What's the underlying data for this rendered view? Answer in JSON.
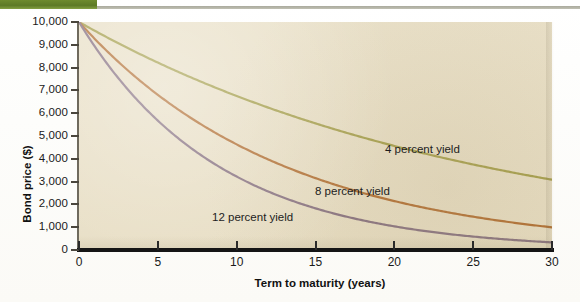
{
  "figure": {
    "background_color": "#e7ddc2",
    "page_color": "#ffffff",
    "accent_tab_color": "#5d7a26"
  },
  "chart_data": {
    "type": "line",
    "title": "",
    "xlabel": "Term to maturity (years)",
    "ylabel": "Bond price ($)",
    "xlim": [
      0,
      30
    ],
    "ylim": [
      0,
      10000
    ],
    "grid": false,
    "legend_position": "inline-annotations",
    "x_ticks": [
      0,
      5,
      10,
      15,
      20,
      25,
      30
    ],
    "x_tick_labels": [
      "0",
      "5",
      "10",
      "15",
      "20",
      "25",
      "30"
    ],
    "y_ticks": [
      0,
      1000,
      2000,
      3000,
      4000,
      5000,
      6000,
      7000,
      8000,
      9000,
      10000
    ],
    "y_tick_labels": [
      "0",
      "1,000",
      "2,000",
      "3,000",
      "4,000",
      "5,000",
      "6,000",
      "7,000",
      "8,000",
      "9,000",
      "10,000"
    ],
    "x": [
      0,
      2,
      4,
      6,
      8,
      10,
      12,
      14,
      16,
      18,
      20,
      22,
      24,
      26,
      28,
      30
    ],
    "series": [
      {
        "name": "4 percent yield",
        "color": "#9a9438",
        "yield": 0.04,
        "values": [
          10000,
          9246,
          8548,
          7903,
          7307,
          6756,
          6246,
          5775,
          5339,
          4936,
          4564,
          4220,
          3901,
          3607,
          3335,
          3083
        ]
      },
      {
        "name": "8 percent yield",
        "color": "#a95f1e",
        "yield": 0.08,
        "values": [
          10000,
          8573,
          7350,
          6302,
          5403,
          4632,
          3971,
          3405,
          2919,
          2502,
          2145,
          1839,
          1577,
          1352,
          1159,
          994
        ]
      },
      {
        "name": "12 percent yield",
        "color": "#7a6276",
        "yield": 0.12,
        "values": [
          10000,
          7972,
          6355,
          5066,
          4039,
          3220,
          2567,
          2046,
          1631,
          1300,
          1037,
          827,
          659,
          525,
          419,
          334
        ]
      }
    ],
    "annotations": [
      {
        "text": "4 percent yield",
        "x": 24.4,
        "y": 3900
      },
      {
        "text": "8 percent yield",
        "x": 19.9,
        "y": 2050
      },
      {
        "text": "12 percent yield",
        "x": 13.4,
        "y": 1000
      }
    ]
  }
}
